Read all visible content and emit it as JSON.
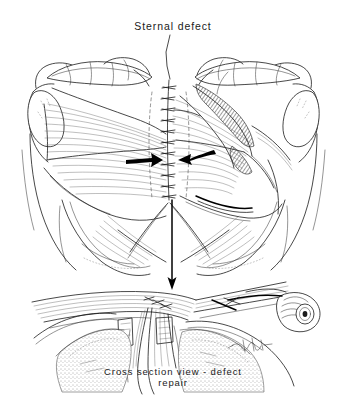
{
  "figure": {
    "kind": "medical-line-illustration",
    "background_color": "#ffffff",
    "ink_color": "#1b1b1b",
    "title_label": "Sternal defect",
    "caption_line1": "Cross section view - defect",
    "caption_line2": "repair",
    "signature": "artist-monogram"
  },
  "annotations": {
    "leader_line": "leader from title down to midline suture",
    "left_arrow": "left flap advancement arrow pointing medially toward midline",
    "right_arrow": "right flap advancement arrow pointing medially toward midline",
    "down_arrow": "vertical arrow linking upper anterior view to lower cross section view"
  },
  "panels": [
    {
      "name": "anterior-view",
      "label": "Anterior chest view",
      "structures": [
        "left clavicle",
        "right clavicle",
        "left humeral head",
        "right humeral head",
        "left pectoralis major flap",
        "right pectoralis major flap",
        "midline suture line",
        "left costal margin",
        "right costal margin",
        "rectus abdominis fibers"
      ]
    },
    {
      "name": "cross-section-view",
      "label": "Cross section view - defect repair",
      "structures": [
        "advanced muscle flaps folded into defect",
        "sternal edges",
        "subcutaneous tissue",
        "cut rib cartilage",
        "suture fixation"
      ]
    }
  ]
}
